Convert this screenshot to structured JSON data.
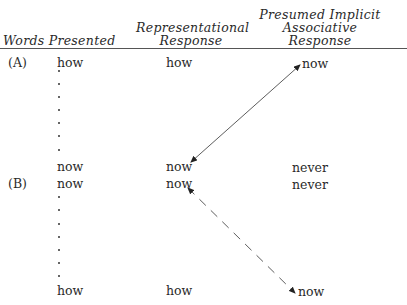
{
  "headers": {
    "words_presented": "Words Presented",
    "representational": [
      "Representational",
      "Response"
    ],
    "implicit": [
      "Presumed Implicit",
      "Associative",
      "Response"
    ]
  },
  "section_a": {
    "label": "(A)",
    "top": {
      "presented": "how",
      "representational": "how",
      "implicit": "now"
    },
    "bottom": {
      "presented": "now",
      "representational": "now",
      "implicit": "never"
    },
    "arrow": {
      "style": "solid",
      "from": "implicit.top",
      "to": "representational.bottom",
      "bidirectional": true
    }
  },
  "section_b": {
    "label": "(B)",
    "top": {
      "presented": "now",
      "representational": "now",
      "implicit": "never"
    },
    "bottom": {
      "presented": "how",
      "representational": "how",
      "implicit": "now"
    },
    "arrow": {
      "style": "dashed",
      "from": "representational.top",
      "to": "implicit.bottom",
      "bidirectional": true
    }
  },
  "ellipsis_dots": 7
}
